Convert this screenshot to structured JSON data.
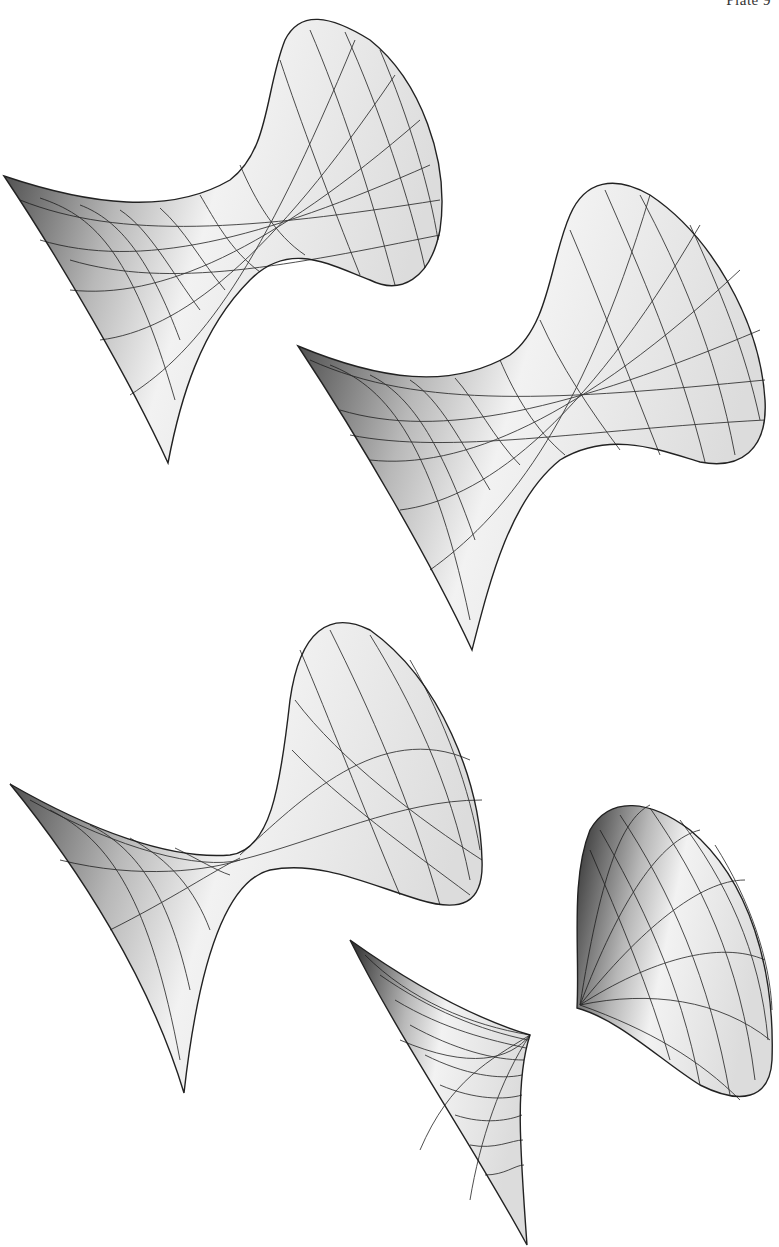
{
  "page": {
    "plate_label": "Plate 9"
  },
  "figures": [
    {
      "name": "surface-1",
      "kind": "hyperboloid-funnel"
    },
    {
      "name": "surface-2",
      "kind": "hyperboloid-funnel"
    },
    {
      "name": "surface-3",
      "kind": "pinched-funnel"
    },
    {
      "name": "surface-4",
      "kind": "degenerate-cusp"
    },
    {
      "name": "surface-5",
      "kind": "cone-funnel"
    }
  ]
}
